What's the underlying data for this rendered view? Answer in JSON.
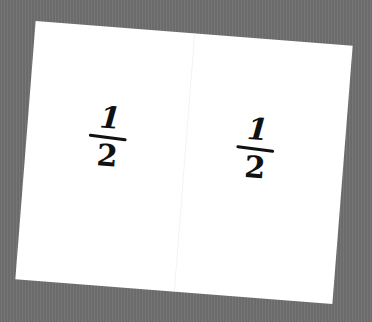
{
  "scene": {
    "description": "Photographed sheet of white paper, slightly rotated, on a gray textured background",
    "background_color": "#6e6e6e",
    "paper_color": "#ffffff",
    "ink_color": "#111111"
  },
  "fractions": [
    {
      "numerator": "1",
      "denominator": "2"
    },
    {
      "numerator": "1",
      "denominator": "2"
    }
  ]
}
